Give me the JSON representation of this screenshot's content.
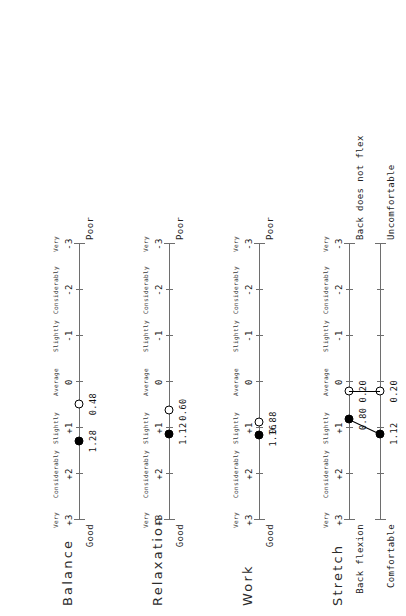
{
  "figure": {
    "orientation": "rotated-90-ccw",
    "scale_words": [
      "Very",
      "Considerably",
      "Slightly",
      "Average",
      "Slightly",
      "Considerably",
      "Very"
    ],
    "scale_ticks": [
      "+3",
      "+2",
      "+1",
      "0",
      "-1",
      "-2",
      "-3"
    ],
    "left_end_label": "Good",
    "right_end_label": "Poor",
    "marker_filled_name": "filled-circle-marker",
    "marker_open_name": "open-circle-marker"
  },
  "chart_data": [
    {
      "type": "scatter",
      "title": "Balance",
      "xlabel": "",
      "ylabel": "",
      "xlim": [
        3,
        -3
      ],
      "categories": [
        "+3",
        "+2",
        "+1",
        "0",
        "-1",
        "-2",
        "-3"
      ],
      "tick_words": [
        "Very",
        "Considerably",
        "Slightly",
        "Average",
        "Slightly",
        "Considerably",
        "Very"
      ],
      "axis_left_label": "Good",
      "axis_right_label": "Poor",
      "grid": false,
      "legend": "none",
      "series": [
        {
          "name": "filled",
          "marker": "filled-circle",
          "values": [
            1.28
          ],
          "labels": [
            "1.28"
          ]
        },
        {
          "name": "open",
          "marker": "open-circle",
          "values": [
            0.48
          ],
          "labels": [
            "0.48"
          ]
        }
      ]
    },
    {
      "type": "scatter",
      "title": "Relaxation",
      "xlabel": "",
      "ylabel": "",
      "xlim": [
        3,
        -3
      ],
      "categories": [
        "+3",
        "+2",
        "+1",
        "0",
        "-1",
        "-2",
        "-3"
      ],
      "tick_words": [
        "Very",
        "Considerably",
        "Slightly",
        "Average",
        "Slightly",
        "Considerably",
        "Very"
      ],
      "axis_left_label": "Good",
      "axis_right_label": "Poor",
      "grid": false,
      "legend": "none",
      "series": [
        {
          "name": "filled",
          "marker": "filled-circle",
          "values": [
            1.12
          ],
          "labels": [
            "1.12"
          ]
        },
        {
          "name": "open",
          "marker": "open-circle",
          "values": [
            0.6
          ],
          "labels": [
            "0.60"
          ]
        }
      ]
    },
    {
      "type": "scatter",
      "title": "Work",
      "xlabel": "",
      "ylabel": "",
      "xlim": [
        3,
        -3
      ],
      "categories": [
        "+3",
        "+2",
        "+1",
        "0",
        "-1",
        "-2",
        "-3"
      ],
      "tick_words": [
        "Very",
        "Considerably",
        "Slightly",
        "Average",
        "Slightly",
        "Considerably",
        "Very"
      ],
      "axis_left_label": "Good",
      "axis_right_label": "Poor",
      "grid": false,
      "legend": "none",
      "series": [
        {
          "name": "filled",
          "marker": "filled-circle",
          "values": [
            1.16
          ],
          "labels": [
            "1.16"
          ]
        },
        {
          "name": "open",
          "marker": "open-circle",
          "values": [
            0.88
          ],
          "labels": [
            "0.88"
          ]
        }
      ]
    },
    {
      "type": "scatter",
      "title": "Stretch",
      "xlabel": "",
      "ylabel": "",
      "xlim": [
        3,
        -3
      ],
      "categories": [
        "+3",
        "+2",
        "+1",
        "0",
        "-1",
        "-2",
        "-3"
      ],
      "tick_words": [
        "Very",
        "Considerably",
        "Slightly",
        "Average",
        "Slightly",
        "Considerably",
        "Very"
      ],
      "grid": false,
      "legend": "none",
      "rows": [
        {
          "row_left_label": "Back flexion",
          "row_right_label": "Back does not flex",
          "filled": {
            "value": 0.8,
            "label": "0.80"
          },
          "open": {
            "value": 0.2,
            "label": "0.20"
          }
        },
        {
          "row_left_label": "Comfortable",
          "row_right_label": "Uncomfortable",
          "filled": {
            "value": 1.12,
            "label": "1.12"
          },
          "open": {
            "value": 0.2,
            "label": "0.20"
          }
        }
      ]
    }
  ]
}
